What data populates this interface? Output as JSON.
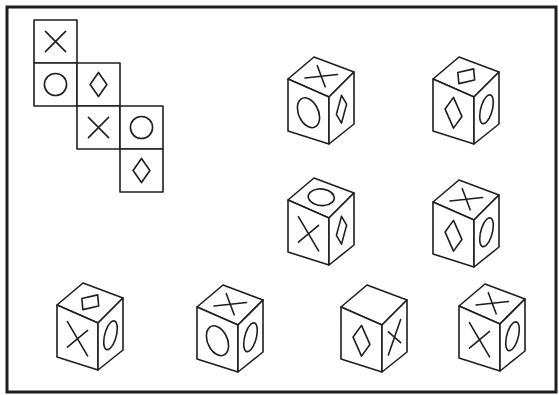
{
  "puzzle": {
    "type": "cube-net-folding",
    "stroke_color": "#1e1e1e",
    "background_color": "#ffffff",
    "net": {
      "cell_size": 43,
      "cells": [
        {
          "col": 0,
          "row": 0,
          "symbol": "x"
        },
        {
          "col": 0,
          "row": 1,
          "symbol": "circle"
        },
        {
          "col": 1,
          "row": 1,
          "symbol": "diamond"
        },
        {
          "col": 1,
          "row": 2,
          "symbol": "x"
        },
        {
          "col": 2,
          "row": 2,
          "symbol": "circle"
        },
        {
          "col": 2,
          "row": 3,
          "symbol": "diamond"
        }
      ]
    },
    "cubes": [
      {
        "id": 1,
        "top": "x",
        "front": "circle",
        "right": "diamond"
      },
      {
        "id": 2,
        "top": "diamond",
        "front": "diamond",
        "right": "circle"
      },
      {
        "id": 3,
        "top": "circle",
        "front": "x",
        "right": "diamond"
      },
      {
        "id": 4,
        "top": "x",
        "front": "diamond",
        "right": "circle"
      },
      {
        "id": 5,
        "top": "diamond",
        "front": "x",
        "right": "circle"
      },
      {
        "id": 6,
        "top": "x",
        "front": "circle",
        "right": "circle"
      },
      {
        "id": 7,
        "top": "blank",
        "front": "diamond",
        "right": "x"
      },
      {
        "id": 8,
        "top": "x",
        "front": "x",
        "right": "circle"
      }
    ]
  }
}
